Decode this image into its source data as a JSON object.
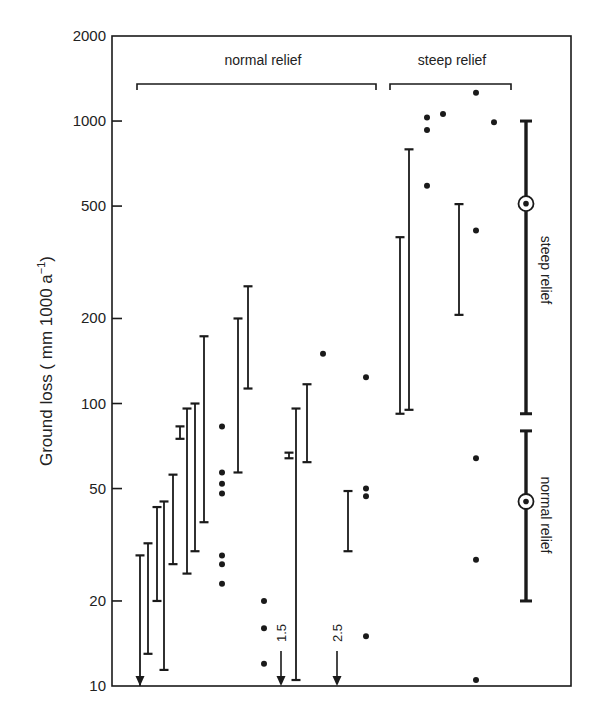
{
  "chart_data": {
    "type": "scatter",
    "title": "",
    "xlabel": "",
    "ylabel": "Ground loss ( mm 1000 a⁻¹)",
    "yscale": "log",
    "ylim": [
      10,
      2000
    ],
    "yticks": [
      10,
      20,
      50,
      100,
      200,
      500,
      1000,
      2000
    ],
    "ytick_labels": [
      "10",
      "20",
      "50",
      "100",
      "200",
      "500",
      "1000",
      "2000"
    ],
    "grid": false,
    "groups": [
      {
        "label": "normal relief",
        "bracket_x": [
          137,
          376
        ]
      },
      {
        "label": "steep relief",
        "bracket_x": [
          390,
          511
        ]
      }
    ],
    "range_bars": [
      {
        "group": "normal relief",
        "x": 140,
        "low": null,
        "high": 29,
        "low_arrow": true
      },
      {
        "group": "normal relief",
        "x": 148,
        "low": 13,
        "high": 32
      },
      {
        "group": "normal relief",
        "x": 157,
        "low": 20,
        "high": 43
      },
      {
        "group": "normal relief",
        "x": 164,
        "low": 11.4,
        "high": 45
      },
      {
        "group": "normal relief",
        "x": 173,
        "low": 27,
        "high": 56
      },
      {
        "group": "normal relief",
        "x": 180,
        "low": 75,
        "high": 83
      },
      {
        "group": "normal relief",
        "x": 187,
        "low": 25,
        "high": 96
      },
      {
        "group": "normal relief",
        "x": 195,
        "low": 30,
        "high": 100
      },
      {
        "group": "normal relief",
        "x": 204,
        "low": 38,
        "high": 173
      },
      {
        "group": "normal relief",
        "x": 238,
        "low": 57,
        "high": 200
      },
      {
        "group": "normal relief",
        "x": 248,
        "low": 113,
        "high": 260
      },
      {
        "group": "normal relief",
        "x": 289,
        "low": 64,
        "high": 67
      },
      {
        "group": "normal relief",
        "x": 296,
        "low": 10.5,
        "high": 96
      },
      {
        "group": "normal relief",
        "x": 307,
        "low": 62,
        "high": 117
      },
      {
        "group": "normal relief",
        "x": 348,
        "low": 30,
        "high": 49
      },
      {
        "group": "steep relief",
        "x": 400,
        "low": 92,
        "high": 388
      },
      {
        "group": "steep relief",
        "x": 409,
        "low": 95,
        "high": 794
      },
      {
        "group": "steep relief",
        "x": 459,
        "low": 206,
        "high": 508
      }
    ],
    "points": [
      {
        "group": "normal relief",
        "x": 222,
        "values": [
          83,
          57,
          52,
          48,
          29,
          27,
          23
        ]
      },
      {
        "group": "normal relief",
        "x": 264,
        "values": [
          20,
          16,
          12
        ]
      },
      {
        "group": "normal relief",
        "x": 323,
        "values": [
          150
        ]
      },
      {
        "group": "normal relief",
        "x": 366,
        "values": [
          124,
          50,
          47,
          15
        ]
      },
      {
        "group": "steep relief",
        "x": 427,
        "values": [
          1030,
          930,
          590
        ]
      },
      {
        "group": "steep relief",
        "x": 443,
        "values": [
          1060
        ]
      },
      {
        "group": "steep relief",
        "x": 476,
        "values": [
          1260,
          410,
          64,
          28,
          10.5
        ]
      },
      {
        "group": "steep relief",
        "x": 494,
        "values": [
          990
        ]
      }
    ],
    "below_axis_arrows": [
      {
        "x": 281,
        "label": "1.5",
        "value": 1.5
      },
      {
        "x": 337,
        "label": "2.5",
        "value": 2.5
      }
    ],
    "summary_bars": [
      {
        "label": "steep relief",
        "x": 526,
        "low": 92,
        "high": 1000,
        "mean": 510
      },
      {
        "label": "normal relief",
        "x": 526,
        "low": 20,
        "high": 80,
        "mean": 45
      }
    ]
  },
  "labels": {
    "ylabel": "Ground loss ( mm 1000 a",
    "ylabel_sup": "−1",
    "ylabel_close": ")",
    "group_normal": "normal relief",
    "group_steep": "steep relief",
    "summary_steep": "steep relief",
    "summary_normal": "normal relief"
  },
  "colors": {
    "ink": "#1a1a1a",
    "background": "#ffffff"
  }
}
